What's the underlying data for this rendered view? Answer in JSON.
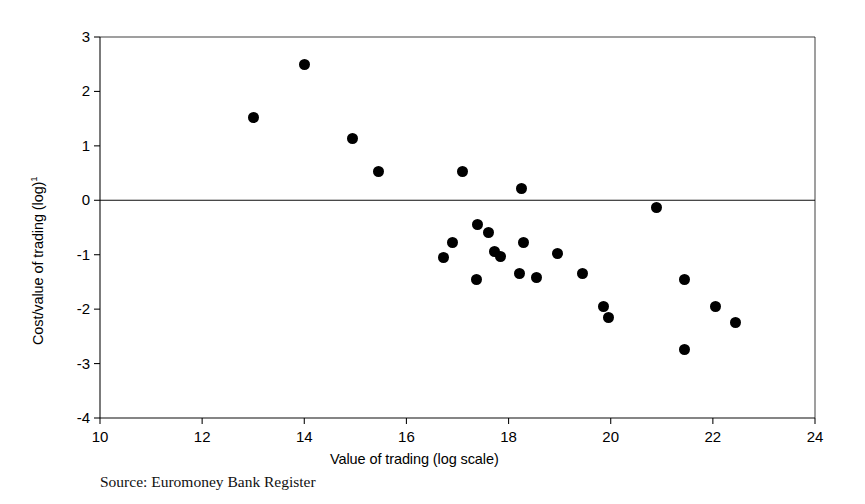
{
  "figure": {
    "source_note": "Source: Euromoney Bank Register",
    "background_color": "#ffffff",
    "marker_color": "#000000",
    "axis_color": "#000000"
  },
  "chart_data": {
    "type": "scatter",
    "title": "",
    "subtitle": "",
    "xlabel": "Value of trading (log scale)",
    "ylabel": "Cost/value of trading (log)¹",
    "ylabel_text": "Cost/value of trading (log)",
    "ylabel_superscript": "1",
    "xlim": [
      10,
      24
    ],
    "ylim": [
      -4,
      3
    ],
    "xticks": [
      10,
      12,
      14,
      16,
      18,
      20,
      22,
      24
    ],
    "yticks": [
      3,
      2,
      1,
      0,
      -1,
      -2,
      -3,
      -4
    ],
    "xtick_labels": [
      "10",
      "12",
      "14",
      "16",
      "18",
      "20",
      "22",
      "24"
    ],
    "ytick_labels": [
      "3",
      "2",
      "1",
      "0",
      "-1",
      "-2",
      "-3",
      "-4"
    ],
    "grid": false,
    "legend": null,
    "legend_position": "none",
    "annotations": [
      {
        "type": "reference-line",
        "axis": "y",
        "value": 0,
        "label": "zero line"
      }
    ],
    "marker": "filled-circle",
    "marker_size_px": 11,
    "n_points": 25,
    "points": [
      {
        "x": 13.0,
        "y": 1.52
      },
      {
        "x": 14.0,
        "y": 2.5
      },
      {
        "x": 14.95,
        "y": 1.13
      },
      {
        "x": 15.45,
        "y": 0.52
      },
      {
        "x": 17.1,
        "y": 0.53
      },
      {
        "x": 18.25,
        "y": 0.22
      },
      {
        "x": 20.9,
        "y": -0.13
      },
      {
        "x": 17.4,
        "y": -0.45
      },
      {
        "x": 17.6,
        "y": -0.6
      },
      {
        "x": 16.9,
        "y": -0.77
      },
      {
        "x": 18.3,
        "y": -0.78
      },
      {
        "x": 17.72,
        "y": -0.95
      },
      {
        "x": 17.84,
        "y": -1.03
      },
      {
        "x": 18.95,
        "y": -0.97
      },
      {
        "x": 16.72,
        "y": -1.06
      },
      {
        "x": 17.38,
        "y": -1.45
      },
      {
        "x": 18.22,
        "y": -1.35
      },
      {
        "x": 18.55,
        "y": -1.42
      },
      {
        "x": 19.45,
        "y": -1.35
      },
      {
        "x": 21.45,
        "y": -1.45
      },
      {
        "x": 19.85,
        "y": -1.95
      },
      {
        "x": 19.95,
        "y": -2.16
      },
      {
        "x": 22.05,
        "y": -1.96
      },
      {
        "x": 22.45,
        "y": -2.24
      },
      {
        "x": 21.45,
        "y": -2.75
      }
    ]
  }
}
